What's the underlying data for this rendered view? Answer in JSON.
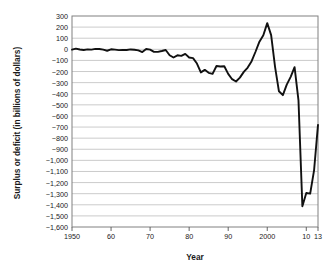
{
  "chart_data": {
    "type": "line",
    "title": "",
    "xlabel": "Year",
    "ylabel": "Surplus or deficit (in billions of dollars)",
    "xlim": [
      1950,
      2013
    ],
    "ylim": [
      -1600,
      300
    ],
    "grid": true,
    "legend": null,
    "line_color": "#111111",
    "plot_bg": "#ffffff",
    "border_color": "#808080",
    "grid_color": "#b5b5b5",
    "ytick_labels": [
      "300",
      "200",
      "100",
      "0",
      "−100",
      "−200",
      "−300",
      "−400",
      "−500",
      "−600",
      "−700",
      "−800",
      "−900",
      "−1,000",
      "−1,100",
      "−1,200",
      "−1,300",
      "−1,400",
      "−1,500",
      "−1,600"
    ],
    "ytick_values": [
      300,
      200,
      100,
      0,
      -100,
      -200,
      -300,
      -400,
      -500,
      -600,
      -700,
      -800,
      -900,
      -1000,
      -1100,
      -1200,
      -1300,
      -1400,
      -1500,
      -1600
    ],
    "xtick_labels": [
      "1950",
      "60",
      "70",
      "80",
      "90",
      "2000",
      "10",
      "13"
    ],
    "xtick_values": [
      1950,
      1960,
      1970,
      1980,
      1990,
      2000,
      2010,
      2013
    ],
    "x": [
      1950,
      1951,
      1952,
      1953,
      1954,
      1955,
      1956,
      1957,
      1958,
      1959,
      1960,
      1961,
      1962,
      1963,
      1964,
      1965,
      1966,
      1967,
      1968,
      1969,
      1970,
      1971,
      1972,
      1973,
      1974,
      1975,
      1976,
      1977,
      1978,
      1979,
      1980,
      1981,
      1982,
      1983,
      1984,
      1985,
      1986,
      1987,
      1988,
      1989,
      1990,
      1991,
      1992,
      1993,
      1994,
      1995,
      1996,
      1997,
      1998,
      1999,
      2000,
      2001,
      2002,
      2003,
      2004,
      2005,
      2006,
      2007,
      2008,
      2009,
      2010,
      2011,
      2012,
      2013
    ],
    "values": [
      -3,
      6,
      -2,
      -6,
      -1,
      -3,
      4,
      3,
      -3,
      -13,
      0,
      -3,
      -7,
      -5,
      -6,
      -1,
      -4,
      -9,
      -25,
      3,
      -3,
      -23,
      -23,
      -15,
      -6,
      -53,
      -74,
      -54,
      -59,
      -41,
      -74,
      -79,
      -128,
      -208,
      -185,
      -212,
      -221,
      -150,
      -155,
      -153,
      -221,
      -269,
      -290,
      -255,
      -203,
      -164,
      -107,
      -22,
      69,
      126,
      236,
      128,
      -158,
      -378,
      -413,
      -318,
      -248,
      -161,
      -459,
      -1413,
      -1294,
      -1300,
      -1087,
      -680
    ],
    "series_name": "Federal surplus or deficit",
    "annotations": {
      "peak_surplus": {
        "year": 2000,
        "value": 236
      },
      "trough_deficit": {
        "year": 2009,
        "value": -1413
      }
    }
  },
  "axis": {
    "x_title": "Year",
    "y_title": "Surplus or deficit (in billions of dollars)"
  }
}
